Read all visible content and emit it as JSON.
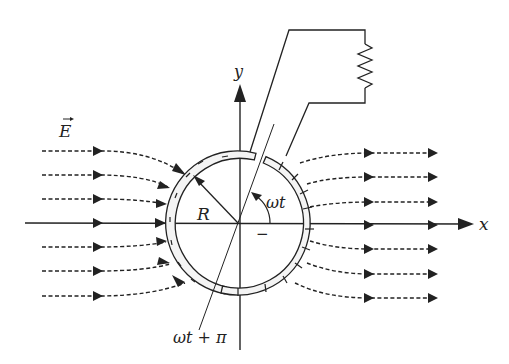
{
  "diagram": {
    "labels": {
      "field": "E",
      "x_axis": "x",
      "y_axis": "y",
      "radius": "R",
      "angle": "ωt",
      "angle_opposite": "ωt + π",
      "minus": "−"
    },
    "colors": {
      "line": "#222222",
      "background": "#ffffff"
    },
    "field_line_count_per_side": 7,
    "components": [
      "split conducting ring",
      "resistor",
      "uniform electric field lines",
      "x-y axes"
    ]
  }
}
